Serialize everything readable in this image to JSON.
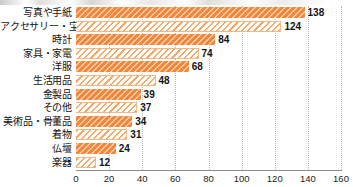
{
  "chart_data": {
    "type": "bar",
    "orientation": "horizontal",
    "title": "",
    "xlabel": "",
    "ylabel": "",
    "xlim": [
      0,
      160
    ],
    "xticks": [
      0,
      20,
      40,
      60,
      80,
      100,
      120,
      140,
      160
    ],
    "grid": "vertical-dotted",
    "legend": "none",
    "categories": [
      "写真や手紙",
      "アクセサリー・宝石",
      "時計",
      "家具・家電",
      "洋服",
      "生活用品",
      "金製品",
      "その他",
      "美術品・骨董品",
      "着物",
      "仏壇",
      "楽器"
    ],
    "values": [
      138,
      124,
      84,
      74,
      68,
      48,
      39,
      37,
      34,
      31,
      24,
      12
    ],
    "bar_styles": [
      "dark",
      "light",
      "dark",
      "light",
      "dark",
      "light",
      "dark",
      "light",
      "dark",
      "light",
      "dark",
      "light"
    ],
    "colors": {
      "bar_dark": "#f2883c",
      "bar_light_stripe": "#f6a968",
      "bar_light_fill": "#ffffff",
      "gridline": "#b9b9b9",
      "axis": "#8d8d8d",
      "text": "#151515"
    }
  }
}
